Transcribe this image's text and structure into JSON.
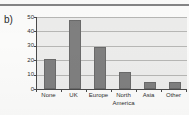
{
  "figure": {
    "panel_label": "b)"
  },
  "chart_data": {
    "type": "bar",
    "title": "",
    "xlabel": "",
    "ylabel": "",
    "categories": [
      "None",
      "UK",
      "Europe",
      "North\nAmerica",
      "Asia",
      "Other"
    ],
    "values": [
      21,
      48,
      29,
      12,
      5,
      5
    ],
    "ylim": [
      0,
      50
    ],
    "ytick_labels": [
      "0",
      "10",
      "20",
      "30",
      "40",
      "50"
    ],
    "ytick_values": [
      0,
      10,
      20,
      30,
      40,
      50
    ],
    "grid": true,
    "legend": null,
    "bar_color": "#7f7f7f",
    "plot_background": "#ececeb",
    "axis_color": "#4a4a4a",
    "gridline_color": "#b6b6b4"
  }
}
